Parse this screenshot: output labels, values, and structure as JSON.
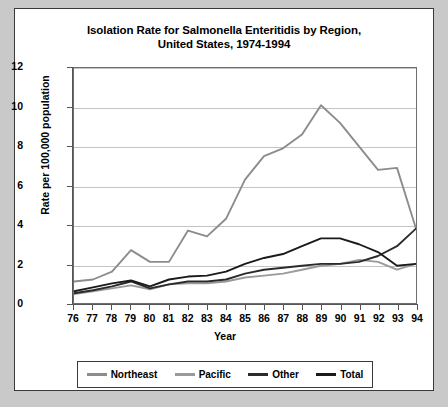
{
  "chart_data": {
    "type": "line",
    "title": "Isolation Rate for Salmonella Enteritidis by Region, United States, 1974-1994",
    "title_line1": "Isolation Rate for Salmonella Enteritidis by Region,",
    "title_line2": "United States, 1974-1994",
    "xlabel": "Year",
    "ylabel": "Rate per 100,000 population",
    "categories": [
      "76",
      "77",
      "78",
      "79",
      "80",
      "81",
      "82",
      "83",
      "84",
      "85",
      "86",
      "87",
      "88",
      "89",
      "90",
      "91",
      "92",
      "93",
      "94"
    ],
    "x": [
      76,
      77,
      78,
      79,
      80,
      81,
      82,
      83,
      84,
      85,
      86,
      87,
      88,
      89,
      90,
      91,
      92,
      93,
      94
    ],
    "ylim": [
      0,
      12
    ],
    "yticks": [
      0,
      2,
      4,
      6,
      8,
      10,
      12
    ],
    "xlim": [
      76,
      94
    ],
    "grid": true,
    "legend_position": "bottom",
    "series": [
      {
        "name": "Northeast",
        "color": "#8c8c8c",
        "values": [
          1.1,
          1.2,
          1.6,
          2.7,
          2.1,
          2.1,
          3.7,
          3.4,
          4.3,
          6.3,
          7.5,
          7.9,
          8.6,
          10.1,
          9.2,
          8.0,
          6.8,
          6.9,
          3.8
        ]
      },
      {
        "name": "Pacific",
        "color": "#9a9a9a",
        "values": [
          0.45,
          0.6,
          0.75,
          0.9,
          0.7,
          0.95,
          1.0,
          1.0,
          1.1,
          1.3,
          1.4,
          1.5,
          1.7,
          1.9,
          2.0,
          2.2,
          2.1,
          1.7,
          2.0
        ]
      },
      {
        "name": "Other",
        "color": "#2b2b2b",
        "values": [
          0.5,
          0.65,
          0.85,
          1.1,
          0.75,
          0.95,
          1.1,
          1.1,
          1.2,
          1.5,
          1.7,
          1.8,
          1.9,
          2.0,
          2.0,
          2.1,
          2.4,
          2.9,
          3.8
        ]
      },
      {
        "name": "Total",
        "color": "#1a1a1a",
        "values": [
          0.6,
          0.8,
          1.0,
          1.15,
          0.85,
          1.2,
          1.35,
          1.4,
          1.6,
          2.0,
          2.3,
          2.5,
          2.9,
          3.3,
          3.3,
          3.0,
          2.6,
          1.9,
          2.0
        ]
      }
    ]
  },
  "legend": {
    "items": [
      {
        "label": "Northeast"
      },
      {
        "label": "Pacific"
      },
      {
        "label": "Other"
      },
      {
        "label": "Total"
      }
    ]
  }
}
